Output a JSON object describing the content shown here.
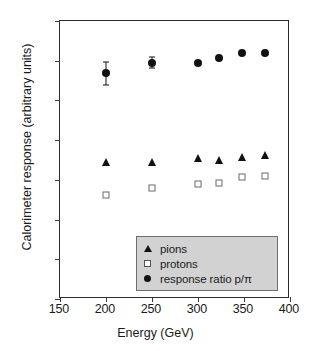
{
  "chart_data": {
    "type": "scatter",
    "title": "",
    "xlabel": "Energy (GeV)",
    "ylabel": "Calorimeter response (arbitrary units)",
    "xlim": [
      150,
      400
    ],
    "ylim": [
      0.3,
      1.0
    ],
    "xticks": [
      "150",
      "200",
      "250",
      "300",
      "350",
      "400"
    ],
    "xtick_values": [
      150,
      200,
      250,
      300,
      350,
      400
    ],
    "yticks": [
      "0.3",
      "0.4",
      "0.5",
      "0.6",
      "0.7",
      "0.8",
      "0.9",
      "1"
    ],
    "ytick_values": [
      0.3,
      0.4,
      0.5,
      0.6,
      0.7,
      0.8,
      0.9,
      1.0
    ],
    "grid": false,
    "legend_position": "lower right",
    "x": [
      200,
      250,
      300,
      323,
      348,
      373
    ],
    "series": [
      {
        "name": "pions",
        "marker": "filled-triangle",
        "color": "#111111",
        "values": [
          0.645,
          0.645,
          0.656,
          0.65,
          0.657,
          0.662
        ],
        "errors": [
          0,
          0,
          0,
          0,
          0,
          0
        ]
      },
      {
        "name": "protons",
        "marker": "open-square",
        "color": "#6a6a6a",
        "values": [
          0.562,
          0.58,
          0.589,
          0.592,
          0.606,
          0.61
        ],
        "errors": [
          0,
          0,
          0,
          0,
          0,
          0
        ]
      },
      {
        "name": "response  ratio  p/π",
        "marker": "filled-circle",
        "color": "#111111",
        "values": [
          0.868,
          0.895,
          0.894,
          0.907,
          0.92,
          0.919
        ],
        "errors": [
          0.028,
          0.014,
          0.005,
          0.005,
          0.004,
          0.004
        ]
      }
    ]
  },
  "legend": {
    "rows": [
      {
        "symbol": "filled-triangle",
        "label": "pions"
      },
      {
        "symbol": "open-square",
        "label": "protons"
      },
      {
        "symbol": "filled-circle",
        "label": "response  ratio  p/π"
      }
    ],
    "background": "#d2d2d2",
    "border": "#6e6e6e"
  },
  "axes": {
    "x_title": "Energy (GeV)",
    "y_title": "Calorimeter response (arbitrary units)"
  }
}
